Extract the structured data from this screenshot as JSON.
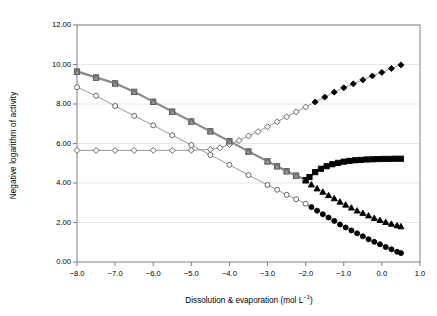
{
  "chart_data": {
    "type": "line",
    "title": "",
    "xlabel": "Dissolution & evaporation (mol L⁻¹)",
    "ylabel": "Negative logarithm of activity",
    "xlim": [
      -8.0,
      1.0
    ],
    "ylim": [
      0.0,
      12.0
    ],
    "xticks": [
      -8.0,
      -7.0,
      -6.0,
      -5.0,
      -4.0,
      -3.0,
      -2.0,
      -1.0,
      0.0,
      1.0
    ],
    "xtick_labels": [
      "−8.0",
      "−7.0",
      "−6.0",
      "−5.0",
      "−4.0",
      "−3.0",
      "−2.0",
      "−1.0",
      "0.0",
      "1.0"
    ],
    "yticks": [
      0.0,
      2.0,
      4.0,
      6.0,
      8.0,
      10.0,
      12.0
    ],
    "ytick_labels": [
      "0.00",
      "2.00",
      "4.00",
      "6.00",
      "8.00",
      "10.00",
      "12.00"
    ],
    "grid": "horizontal",
    "legend": "none",
    "series": [
      {
        "name": "diamond-series",
        "marker": "diamond",
        "open_marker_color": "#ffffff",
        "filled_marker_color": "#000000",
        "line_color": "#808080",
        "line_width": 0.8,
        "fill_from_x": -1.75,
        "x": [
          -8.0,
          -7.5,
          -7.0,
          -6.5,
          -6.0,
          -5.5,
          -5.0,
          -4.5,
          -4.25,
          -4.0,
          -3.75,
          -3.5,
          -3.25,
          -3.0,
          -2.75,
          -2.5,
          -2.25,
          -2.0,
          -1.75,
          -1.5,
          -1.25,
          -1.0,
          -0.75,
          -0.5,
          -0.25,
          0.0,
          0.25,
          0.5
        ],
        "y": [
          5.65,
          5.65,
          5.65,
          5.65,
          5.65,
          5.65,
          5.66,
          5.7,
          5.78,
          5.95,
          6.15,
          6.38,
          6.6,
          6.85,
          7.1,
          7.35,
          7.6,
          7.85,
          8.1,
          8.35,
          8.6,
          8.82,
          9.02,
          9.22,
          9.42,
          9.6,
          9.8,
          9.98
        ]
      },
      {
        "name": "square-series",
        "marker": "square",
        "open_marker_color": "#9a9a9a",
        "filled_marker_color": "#000000",
        "line_color": "#8c8c8c",
        "line_width": 2.2,
        "fill_from_x": -2.0,
        "x": [
          -8.0,
          -7.5,
          -7.0,
          -6.5,
          -6.0,
          -5.5,
          -5.0,
          -4.5,
          -4.0,
          -3.5,
          -3.0,
          -2.75,
          -2.5,
          -2.25,
          -2.0,
          -1.9,
          -1.75,
          -1.6,
          -1.45,
          -1.3,
          -1.15,
          -1.0,
          -0.85,
          -0.7,
          -0.55,
          -0.4,
          -0.25,
          -0.1,
          0.05,
          0.2,
          0.35,
          0.5
        ],
        "y": [
          9.65,
          9.35,
          9.05,
          8.62,
          8.12,
          7.62,
          7.12,
          6.62,
          6.12,
          5.6,
          5.1,
          4.85,
          4.6,
          4.38,
          4.15,
          4.3,
          4.55,
          4.72,
          4.85,
          4.95,
          5.02,
          5.08,
          5.12,
          5.15,
          5.17,
          5.19,
          5.2,
          5.21,
          5.22,
          5.22,
          5.23,
          5.23
        ]
      },
      {
        "name": "triangle-series",
        "marker": "triangle",
        "open_marker_color": "#9a9a9a",
        "filled_marker_color": "#000000",
        "line_color": "#8c8c8c",
        "line_width": 0.9,
        "fill_from_x": -2.0,
        "x": [
          -8.0,
          -7.5,
          -7.0,
          -6.5,
          -6.0,
          -5.5,
          -5.0,
          -4.5,
          -4.0,
          -3.5,
          -3.0,
          -2.75,
          -2.5,
          -2.25,
          -2.0,
          -1.85,
          -1.7,
          -1.55,
          -1.4,
          -1.25,
          -1.1,
          -0.95,
          -0.8,
          -0.65,
          -0.5,
          -0.35,
          -0.2,
          -0.05,
          0.1,
          0.25,
          0.4,
          0.5
        ],
        "y": [
          9.62,
          9.32,
          9.02,
          8.6,
          8.1,
          7.6,
          7.1,
          6.6,
          6.1,
          5.58,
          5.08,
          4.83,
          4.58,
          4.36,
          4.12,
          3.92,
          3.72,
          3.55,
          3.38,
          3.22,
          3.05,
          2.9,
          2.75,
          2.6,
          2.48,
          2.35,
          2.22,
          2.12,
          2.02,
          1.93,
          1.85,
          1.8
        ]
      },
      {
        "name": "circle-series",
        "marker": "circle",
        "open_marker_color": "#ffffff",
        "filled_marker_color": "#000000",
        "line_color": "#8c8c8c",
        "line_width": 0.9,
        "fill_from_x": -1.95,
        "x": [
          -8.0,
          -7.5,
          -7.0,
          -6.5,
          -6.0,
          -5.5,
          -5.0,
          -4.5,
          -4.0,
          -3.5,
          -3.0,
          -2.75,
          -2.5,
          -2.25,
          -2.0,
          -1.85,
          -1.7,
          -1.55,
          -1.4,
          -1.25,
          -1.1,
          -0.95,
          -0.8,
          -0.65,
          -0.5,
          -0.35,
          -0.2,
          -0.05,
          0.1,
          0.25,
          0.4,
          0.5
        ],
        "y": [
          8.85,
          8.42,
          7.9,
          7.4,
          6.92,
          6.42,
          5.92,
          5.42,
          4.92,
          4.4,
          3.9,
          3.66,
          3.4,
          3.18,
          2.95,
          2.78,
          2.6,
          2.42,
          2.25,
          2.08,
          1.9,
          1.75,
          1.6,
          1.45,
          1.3,
          1.15,
          1.02,
          0.9,
          0.76,
          0.64,
          0.52,
          0.45
        ]
      }
    ]
  },
  "figure": {
    "background": "#ffffff",
    "axis_color": "#808080",
    "grid_color": "#e2e2e2"
  }
}
